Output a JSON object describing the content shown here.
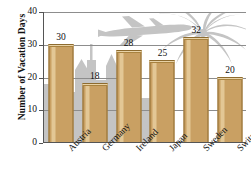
{
  "chart_data": {
    "type": "bar",
    "title": "",
    "xlabel": "",
    "ylabel": "Number of Vacation Days",
    "categories": [
      "Austria",
      "Germany",
      "Ireland",
      "Japan",
      "Sweden",
      "Switzerland"
    ],
    "values": [
      30,
      18,
      28,
      25,
      32,
      20
    ],
    "ylim": [
      0,
      40
    ],
    "yticks": [
      0,
      10,
      20,
      30,
      40
    ],
    "ytick_labels": [
      "0",
      "10",
      "20",
      "30",
      "40"
    ],
    "grid": true,
    "legend": false,
    "data_labels": [
      "30",
      "18",
      "28",
      "25",
      "32",
      "20"
    ],
    "colors": {
      "bar_fill": "#c9a063",
      "bar_edge": "#8d6b2f",
      "bar_highlight": "#e3c795",
      "bar_top": "#e8d2a6",
      "gridline": "#8d8d8d",
      "axis": "#555555",
      "text": "#111111",
      "background": "#ffffff",
      "background_art": "#c2c2c2"
    },
    "background_art": [
      {
        "name": "city-skyline-silhouette"
      },
      {
        "name": "airplane-silhouette"
      },
      {
        "name": "palm-tree-silhouette"
      }
    ]
  }
}
